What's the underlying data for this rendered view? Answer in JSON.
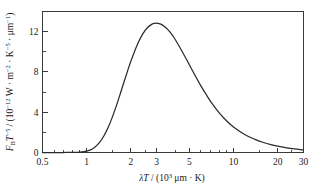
{
  "chart_data": {
    "type": "line",
    "title": "",
    "xlabel": "λT / (10³ μm · K)",
    "ylabel": "Fʙ T⁻⁵ / (10⁻¹² W · m⁻² · K⁻⁵ · μm⁻¹)",
    "xscale": "log",
    "yscale": "linear",
    "xlim": [
      0.5,
      30
    ],
    "ylim": [
      0,
      14
    ],
    "grid": false,
    "legend": false,
    "xticks": [
      0.5,
      1,
      2,
      3,
      5,
      10,
      20,
      30
    ],
    "xticklabels": [
      "0.5",
      "1",
      "2",
      "3",
      "5",
      "10",
      "20",
      "30"
    ],
    "xminorticks": [
      0.6,
      0.7,
      0.8,
      0.9,
      1.5,
      2.5,
      4,
      6,
      7,
      8,
      9,
      15,
      25
    ],
    "yticks": [
      0,
      4,
      8,
      12
    ],
    "yticklabels": [
      "0",
      "4",
      "8",
      "12"
    ],
    "yminorticks": [
      2,
      6,
      10,
      14
    ],
    "peak": {
      "x": 2.898,
      "y": 12.85
    },
    "series": [
      {
        "name": "Planck blackbody spectral distribution",
        "x": [
          0.5,
          0.6,
          0.7,
          0.8,
          0.9,
          1.0,
          1.1,
          1.2,
          1.3,
          1.4,
          1.5,
          1.6,
          1.7,
          1.8,
          1.9,
          2.0,
          2.2,
          2.4,
          2.6,
          2.8,
          2.898,
          3.0,
          3.2,
          3.4,
          3.6,
          3.8,
          4.0,
          4.5,
          5.0,
          5.5,
          6.0,
          6.5,
          7.0,
          8.0,
          9.0,
          10.0,
          12.0,
          14.0,
          16.0,
          18.0,
          20.0,
          23.0,
          26.0,
          30.0
        ],
        "y": [
          0.0,
          0.0,
          0.0,
          0.003,
          0.03,
          0.13,
          0.38,
          0.85,
          1.56,
          2.48,
          3.56,
          4.73,
          5.91,
          7.05,
          8.11,
          9.06,
          10.63,
          11.73,
          12.41,
          12.76,
          12.82,
          12.84,
          12.74,
          12.49,
          12.15,
          11.72,
          11.24,
          9.96,
          8.72,
          7.6,
          6.62,
          5.78,
          5.06,
          3.94,
          3.13,
          2.54,
          1.77,
          1.3,
          0.99,
          0.78,
          0.63,
          0.46,
          0.35,
          0.25
        ]
      }
    ]
  },
  "axis": {
    "x_label_parts": {
      "lambda_T": "λT",
      "slash": " / (10",
      "exp3": "3",
      "units": " μm · K)"
    },
    "y_label_parts": {
      "F": "F",
      "F_sub": "B",
      "T": "T",
      "T_exp": "−5",
      "open": " / (10",
      "coef_exp": "−12",
      "w": " W · m",
      "m_exp": "−2",
      "k": " · K",
      "k_exp": "−5",
      "um": " · μm",
      "um_exp": "−1",
      "close": ")"
    }
  },
  "colors": {
    "curve": "#2b2b2b",
    "axis": "#3a3a3a",
    "background": "#ffffff",
    "text": "#1a1a1a"
  }
}
